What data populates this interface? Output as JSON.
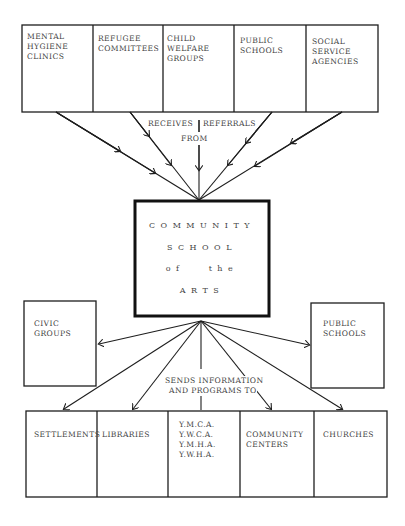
{
  "top_row": {
    "cells": [
      {
        "label": "MENTAL\nHYGIENE\nCLINICS"
      },
      {
        "label": "REFUGEE\nCOMMITTEES"
      },
      {
        "label": "CHILD\nWELFARE\nGROUPS"
      },
      {
        "label": "PUBLIC\nSCHOOLS"
      },
      {
        "label": "SOCIAL\nSERVICE\nAGENCIES"
      }
    ]
  },
  "referral_label": {
    "line1_left": "RECEIVES",
    "line1_right": "REFERRALS",
    "line2": "FROM"
  },
  "center": {
    "lines": [
      "COMMUNITY",
      "SCHOOL",
      "of   the",
      "ARTS"
    ]
  },
  "side_boxes": {
    "left": {
      "label": "CIVIC\nGROUPS"
    },
    "right": {
      "label": "PUBLIC\nSCHOOLS"
    }
  },
  "sends_label": {
    "line1": "SENDS INFORMATION",
    "line2": "AND PROGRAMS TO"
  },
  "bottom_row": {
    "cells": [
      {
        "label": "SETTLEMENTS"
      },
      {
        "label": "LIBRARIES"
      },
      {
        "label": "Y.M.C.A.\nY.W.C.A.\nY.M.H.A.\nY.W.H.A."
      },
      {
        "label": "COMMUNITY\nCENTERS"
      },
      {
        "label": "CHURCHES"
      }
    ]
  },
  "colors": {
    "ink": "#1e1e1e",
    "text": "#444444",
    "background": "#ffffff"
  }
}
